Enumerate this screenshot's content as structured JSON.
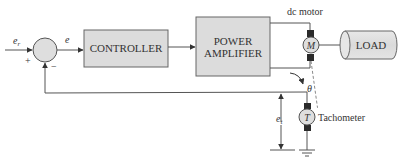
{
  "diagram": {
    "type": "block-diagram",
    "colors": {
      "line": "#555555",
      "block_fill": "#dcdcdc",
      "block_stroke": "#666666",
      "brush": "#2a2a2a",
      "text": "#333333"
    },
    "signals": {
      "reference": {
        "symbol": "e",
        "subscript": "r"
      },
      "error": {
        "symbol": "e"
      },
      "feedback": {
        "symbol": "e",
        "subscript": "t"
      },
      "angle": {
        "symbol": "θ"
      }
    },
    "summing_junction": {
      "plus_sign": "+",
      "minus_sign": "−"
    },
    "blocks": {
      "controller": {
        "label": "CONTROLLER"
      },
      "power_amplifier": {
        "line1": "POWER",
        "line2": "AMPLIFIER"
      },
      "motor": {
        "symbol": "M",
        "label": "dc motor"
      },
      "load": {
        "label": "LOAD"
      },
      "tachometer": {
        "symbol": "T",
        "label": "Tachometer"
      }
    },
    "nodes": [
      "summing-junction",
      "controller",
      "power-amplifier",
      "dc-motor",
      "load",
      "tachometer",
      "ground"
    ],
    "edges": [
      {
        "from": "input",
        "to": "summing-junction",
        "label": "e_r",
        "sign": "+"
      },
      {
        "from": "summing-junction",
        "to": "controller",
        "label": "e"
      },
      {
        "from": "controller",
        "to": "power-amplifier"
      },
      {
        "from": "power-amplifier",
        "to": "dc-motor"
      },
      {
        "from": "dc-motor",
        "to": "load",
        "type": "shaft"
      },
      {
        "from": "dc-motor",
        "to": "tachometer",
        "type": "mechanical-coupling",
        "label": "θ"
      },
      {
        "from": "tachometer",
        "to": "summing-junction",
        "label": "e_t",
        "sign": "−"
      },
      {
        "from": "tachometer",
        "to": "ground"
      }
    ]
  }
}
